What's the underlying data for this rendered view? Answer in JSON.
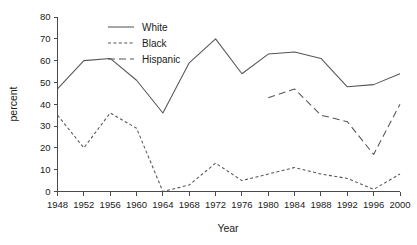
{
  "chart_data": {
    "type": "line",
    "title": "",
    "xlabel": "Year",
    "ylabel": "percent",
    "x": [
      1948,
      1952,
      1956,
      1960,
      1964,
      1968,
      1972,
      1976,
      1980,
      1984,
      1988,
      1992,
      1996,
      2000
    ],
    "xtick_labels": [
      "1948",
      "1952",
      "1956",
      "1960",
      "1964",
      "1968",
      "1972",
      "1976",
      "1980",
      "1984",
      "1988",
      "1992",
      "1996",
      "2000"
    ],
    "ytick_labels": [
      "0",
      "10",
      "20",
      "30",
      "40",
      "50",
      "60",
      "70",
      "80"
    ],
    "yticks": [
      0,
      10,
      20,
      30,
      40,
      50,
      60,
      70,
      80
    ],
    "xlim": [
      1948,
      2000
    ],
    "ylim": [
      0,
      80
    ],
    "grid": false,
    "legend_position": "top-center",
    "series": [
      {
        "name": "White",
        "style": "solid",
        "color": "#555555",
        "x": [
          1948,
          1952,
          1956,
          1960,
          1964,
          1968,
          1972,
          1976,
          1980,
          1984,
          1988,
          1992,
          1996,
          2000
        ],
        "values": [
          47,
          60,
          61,
          51,
          36,
          59,
          70,
          54,
          63,
          64,
          61,
          48,
          49,
          54
        ]
      },
      {
        "name": "Black",
        "style": "dotted",
        "color": "#555555",
        "x": [
          1948,
          1952,
          1956,
          1960,
          1964,
          1968,
          1972,
          1976,
          1980,
          1984,
          1988,
          1992,
          1996,
          2000
        ],
        "values": [
          35,
          20,
          36,
          29,
          0,
          3,
          13,
          5,
          8,
          11,
          8,
          6,
          1,
          8
        ]
      },
      {
        "name": "Hispanic",
        "style": "dashed",
        "color": "#555555",
        "x": [
          1980,
          1984,
          1988,
          1992,
          1996,
          2000
        ],
        "values": [
          43,
          47,
          35,
          32,
          17,
          40
        ]
      }
    ]
  },
  "legend": {
    "entries": [
      {
        "label": "White",
        "style": "solid"
      },
      {
        "label": "Black",
        "style": "dotted"
      },
      {
        "label": "Hispanic",
        "style": "dashed"
      }
    ]
  },
  "axes": {
    "x_title": "Year",
    "y_title": "percent"
  }
}
